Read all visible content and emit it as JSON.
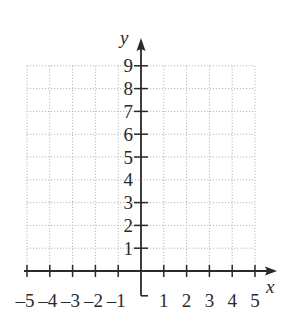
{
  "chart_data": {
    "type": "scatter",
    "title": "",
    "xlabel": "x",
    "ylabel": "y",
    "xlim": [
      -5,
      5
    ],
    "ylim": [
      0,
      9
    ],
    "x_ticks": [
      -5,
      -4,
      -3,
      -2,
      -1,
      1,
      2,
      3,
      4,
      5
    ],
    "y_ticks": [
      1,
      2,
      3,
      4,
      5,
      6,
      7,
      8,
      9
    ],
    "x_tick_labels": [
      "–5",
      "–4",
      "–3",
      "–2",
      "–1",
      "1",
      "2",
      "3",
      "4",
      "5"
    ],
    "y_tick_labels": [
      "1",
      "2",
      "3",
      "4",
      "5",
      "6",
      "7",
      "8",
      "9"
    ],
    "grid": true,
    "grid_style": "dotted",
    "series": [],
    "legend": null
  },
  "colors": {
    "axis": "#2a2a2a",
    "grid": "#b8b8b8",
    "background": "#ffffff"
  }
}
